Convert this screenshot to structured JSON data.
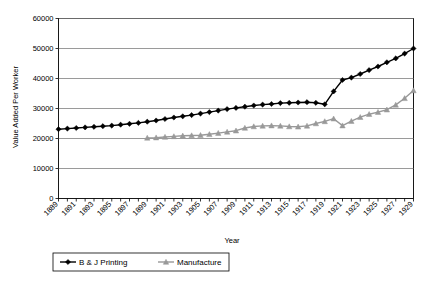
{
  "chart_data": {
    "type": "line",
    "title": "",
    "xlabel": "Year",
    "ylabel": "Value Added Per Worker",
    "ylim": [
      0,
      60000
    ],
    "ytick_labels": [
      "60000",
      "50000",
      "40000",
      "30000",
      "20000",
      "10000",
      "0"
    ],
    "yticks": [
      60000,
      50000,
      40000,
      30000,
      20000,
      10000,
      0
    ],
    "grid": true,
    "legend_position": "bottom",
    "xlim": [
      1889,
      1929
    ],
    "x": [
      1889,
      1890,
      1891,
      1892,
      1893,
      1894,
      1895,
      1896,
      1897,
      1898,
      1899,
      1900,
      1901,
      1902,
      1903,
      1904,
      1905,
      1906,
      1907,
      1908,
      1909,
      1910,
      1911,
      1912,
      1913,
      1914,
      1915,
      1916,
      1917,
      1918,
      1919,
      1920,
      1921,
      1922,
      1923,
      1924,
      1925,
      1926,
      1927,
      1928,
      1929
    ],
    "xtick_labels": [
      "1889",
      "1891",
      "1893",
      "1895",
      "1897",
      "1899",
      "1901",
      "1903",
      "1905",
      "1907",
      "1909",
      "1911",
      "1913",
      "1915",
      "1917",
      "1919",
      "1921",
      "1923",
      "1925",
      "1927",
      "1929"
    ],
    "series": [
      {
        "name": "B & J Printing",
        "color": "#000000",
        "marker": "diamond",
        "values": [
          23100,
          23300,
          23500,
          23700,
          23900,
          24100,
          24300,
          24600,
          24900,
          25200,
          25600,
          26000,
          26500,
          27000,
          27400,
          27800,
          28300,
          28800,
          29300,
          29800,
          30200,
          30600,
          31000,
          31300,
          31500,
          31800,
          31900,
          32000,
          32100,
          31900,
          31400,
          35700,
          39500,
          40300,
          41500,
          42800,
          44000,
          45400,
          46700,
          48300,
          50000
        ]
      },
      {
        "name": "Manufacture",
        "color": "#999999",
        "marker": "triangle",
        "values": [
          null,
          null,
          null,
          null,
          null,
          null,
          null,
          null,
          null,
          null,
          20200,
          20300,
          20500,
          20700,
          20900,
          21000,
          21100,
          21400,
          21800,
          22200,
          22600,
          23500,
          24000,
          24200,
          24300,
          24200,
          24000,
          23900,
          24200,
          25000,
          25700,
          26600,
          24300,
          25800,
          27100,
          28100,
          28800,
          29600,
          31200,
          33400,
          36000
        ]
      }
    ]
  },
  "legend": {
    "entries": [
      {
        "label": "B & J Printing"
      },
      {
        "label": "Manufacture"
      }
    ]
  }
}
